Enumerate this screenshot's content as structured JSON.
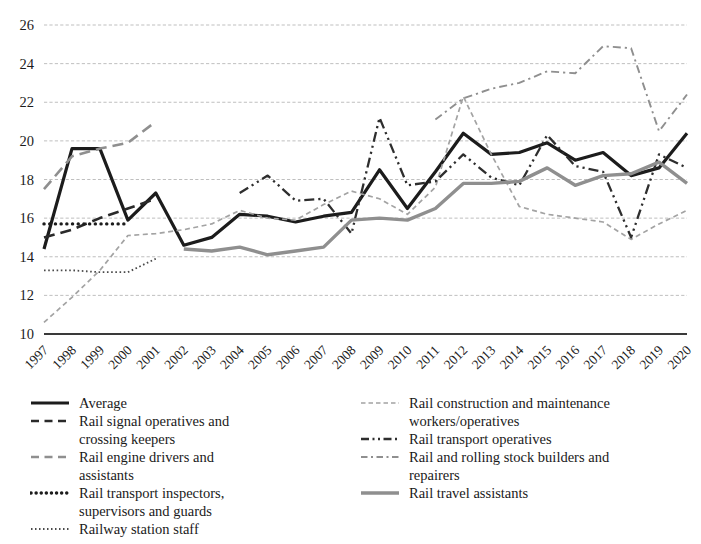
{
  "chart_data": {
    "type": "line",
    "x": [
      1997,
      1998,
      1999,
      2000,
      2001,
      2002,
      2003,
      2004,
      2005,
      2006,
      2007,
      2008,
      2009,
      2010,
      2011,
      2012,
      2013,
      2014,
      2015,
      2016,
      2017,
      2018,
      2019,
      2020
    ],
    "xlabel": "",
    "ylabel": "",
    "ylim": [
      10,
      26
    ],
    "yticks": [
      10,
      12,
      14,
      16,
      18,
      20,
      22,
      24,
      26
    ],
    "grid": true,
    "legend_position": "bottom",
    "series": [
      {
        "name": "Average",
        "line": "solid",
        "color": "#1c1c1c",
        "width": 3.2,
        "values": [
          14.4,
          19.6,
          19.6,
          15.9,
          17.3,
          14.6,
          15.0,
          16.2,
          16.1,
          15.8,
          16.1,
          16.3,
          18.5,
          16.5,
          18.4,
          20.4,
          19.3,
          19.4,
          19.9,
          19.0,
          19.4,
          18.2,
          18.6,
          20.4
        ]
      },
      {
        "name": "Rail signal operatives and crossing keepers",
        "line": "dash",
        "color": "#2a2a2a",
        "width": 2.6,
        "values": [
          15.0,
          15.4,
          16.0,
          16.5,
          17.0,
          null,
          null,
          null,
          null,
          null,
          null,
          null,
          null,
          null,
          null,
          null,
          null,
          null,
          null,
          null,
          null,
          null,
          null,
          null
        ]
      },
      {
        "name": "Rail engine drivers and assistants",
        "line": "dash",
        "color": "#8f8f8f",
        "width": 2.6,
        "values": [
          17.5,
          19.2,
          19.6,
          19.9,
          21.0,
          null,
          null,
          null,
          null,
          null,
          null,
          null,
          null,
          null,
          null,
          null,
          null,
          null,
          null,
          null,
          null,
          null,
          null,
          null
        ]
      },
      {
        "name": "Rail transport inspectors, supervisors and guards",
        "line": "dot-bold",
        "color": "#1c1c1c",
        "width": 3.4,
        "values": [
          15.7,
          15.7,
          15.7,
          15.7,
          null,
          null,
          null,
          null,
          null,
          null,
          null,
          null,
          null,
          null,
          null,
          null,
          null,
          null,
          null,
          null,
          null,
          null,
          null,
          null
        ]
      },
      {
        "name": "Railway station staff",
        "line": "dot",
        "color": "#4a4a4a",
        "width": 1.8,
        "values": [
          13.3,
          13.3,
          13.2,
          13.2,
          13.9,
          null,
          null,
          null,
          null,
          null,
          null,
          null,
          null,
          null,
          null,
          null,
          null,
          null,
          null,
          null,
          null,
          null,
          null,
          null
        ]
      },
      {
        "name": "Rail construction and maintenance workers/operatives",
        "line": "dash-small",
        "color": "#a3a3a3",
        "width": 1.7,
        "values": [
          10.6,
          11.9,
          13.3,
          15.1,
          15.2,
          15.4,
          15.7,
          16.4,
          16.0,
          15.9,
          16.7,
          17.4,
          17.0,
          16.2,
          17.6,
          22.3,
          19.3,
          16.6,
          16.2,
          16.0,
          15.8,
          14.9,
          15.7,
          16.4
        ]
      },
      {
        "name": "Rail transport operatives",
        "line": "dash-dot-dot",
        "color": "#2e2e2e",
        "width": 2.3,
        "values": [
          null,
          null,
          null,
          null,
          null,
          null,
          null,
          17.3,
          18.2,
          16.9,
          17.0,
          15.2,
          21.2,
          17.7,
          17.9,
          19.3,
          18.1,
          17.7,
          20.3,
          18.7,
          18.4,
          15.0,
          19.3,
          18.6
        ]
      },
      {
        "name": "Rail and rolling stock builders and repairers",
        "line": "dash-dot",
        "color": "#8f8f8f",
        "width": 1.9,
        "values": [
          null,
          null,
          null,
          null,
          null,
          null,
          null,
          null,
          null,
          null,
          null,
          null,
          null,
          null,
          21.1,
          22.2,
          22.7,
          23.0,
          23.6,
          23.5,
          24.9,
          24.8,
          20.5,
          22.4
        ]
      },
      {
        "name": "Rail travel assistants",
        "line": "solid",
        "color": "#8f8f8f",
        "width": 3.4,
        "values": [
          null,
          null,
          null,
          null,
          null,
          14.4,
          14.3,
          14.5,
          14.1,
          14.3,
          14.5,
          15.9,
          16.0,
          15.9,
          16.5,
          17.8,
          17.8,
          17.9,
          18.6,
          17.7,
          18.2,
          18.3,
          18.9,
          17.8
        ]
      }
    ]
  },
  "legend": {
    "columns": [
      [
        0,
        1,
        2,
        3,
        4
      ],
      [
        5,
        6,
        7,
        8
      ]
    ]
  }
}
